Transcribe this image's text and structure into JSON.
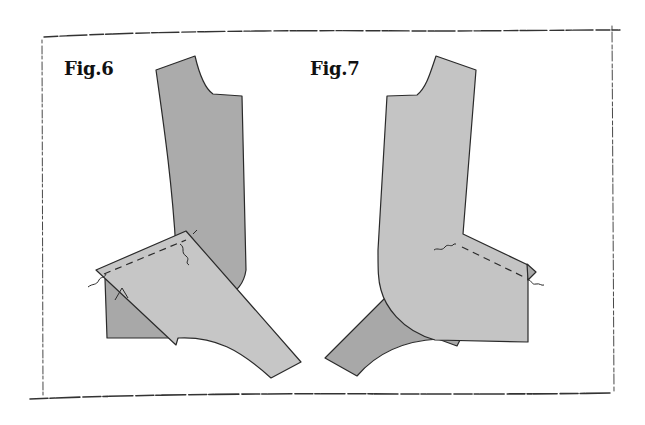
{
  "figures": [
    {
      "label": "Fig.6"
    },
    {
      "label": "Fig.7"
    }
  ],
  "colors": {
    "background": "#ffffff",
    "frame": "#333333",
    "piece_dark": "#a8a8a8",
    "piece_light": "#c4c4c4",
    "outline": "#2a2a2a"
  }
}
